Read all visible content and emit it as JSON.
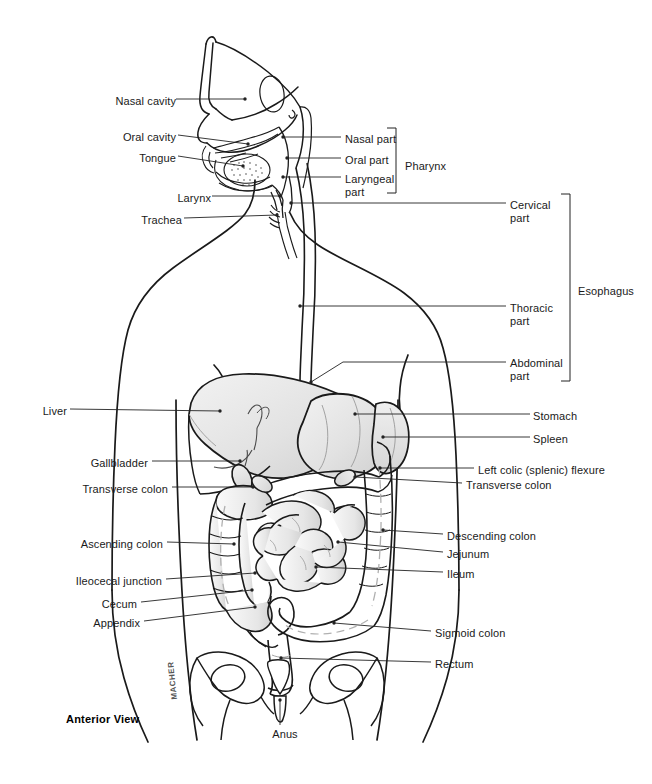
{
  "figure": {
    "view_label": "Anterior View",
    "artist_signature": "MACHER",
    "background_color": "#ffffff",
    "line_color": "#1a1a1a",
    "organ_fill": "#e8e8e8",
    "leader_color": "#222222"
  },
  "labels_left": [
    {
      "id": "nasal-cavity",
      "text": "Nasal cavity",
      "x": 104,
      "y": 95,
      "w": 72
    },
    {
      "id": "oral-cavity",
      "text": "Oral cavity",
      "x": 114,
      "y": 131,
      "w": 62
    },
    {
      "id": "tongue",
      "text": "Tongue",
      "x": 130,
      "y": 152,
      "w": 46
    },
    {
      "id": "larynx",
      "text": "Larynx",
      "x": 165,
      "y": 192,
      "w": 46
    },
    {
      "id": "trachea",
      "text": "Trachea",
      "x": 130,
      "y": 214,
      "w": 52
    },
    {
      "id": "liver",
      "text": "Liver",
      "x": 33,
      "y": 405,
      "w": 34
    },
    {
      "id": "gallbladder",
      "text": "Gallbladder",
      "x": 80,
      "y": 457,
      "w": 68
    },
    {
      "id": "transverse-colon-l",
      "text": "Transverse colon",
      "x": 70,
      "y": 483,
      "w": 98
    },
    {
      "id": "ascending-colon",
      "text": "Ascending colon",
      "x": 63,
      "y": 538,
      "w": 100
    },
    {
      "id": "ileocecal-junction",
      "text": "Ileocecal junction",
      "x": 54,
      "y": 575,
      "w": 108
    },
    {
      "id": "cecum",
      "text": "Cecum",
      "x": 93,
      "y": 598,
      "w": 44
    },
    {
      "id": "appendix",
      "text": "Appendix",
      "x": 84,
      "y": 617,
      "w": 56
    }
  ],
  "labels_right": [
    {
      "id": "nasal-part",
      "text": "Nasal part",
      "x": 345,
      "y": 133,
      "w": 70
    },
    {
      "id": "oral-part",
      "text": "Oral part",
      "x": 345,
      "y": 154,
      "w": 70
    },
    {
      "id": "laryngeal-part",
      "text": "Laryngeal\npart",
      "x": 345,
      "y": 173,
      "w": 70
    },
    {
      "id": "cervical-part",
      "text": "Cervical\npart",
      "x": 510,
      "y": 199,
      "w": 70
    },
    {
      "id": "thoracic-part",
      "text": "Thoracic\npart",
      "x": 510,
      "y": 302,
      "w": 70
    },
    {
      "id": "abdominal-part",
      "text": "Abdominal\npart",
      "x": 510,
      "y": 357,
      "w": 74
    },
    {
      "id": "stomach",
      "text": "Stomach",
      "x": 533,
      "y": 410,
      "w": 70
    },
    {
      "id": "spleen",
      "text": "Spleen",
      "x": 533,
      "y": 433,
      "w": 70
    },
    {
      "id": "left-colic-flexure",
      "text": "Left colic (splenic) flexure",
      "x": 478,
      "y": 464,
      "w": 170
    },
    {
      "id": "transverse-colon-r",
      "text": "Transverse colon",
      "x": 466,
      "y": 479,
      "w": 104
    },
    {
      "id": "descending-colon",
      "text": "Descending colon",
      "x": 447,
      "y": 530,
      "w": 104
    },
    {
      "id": "jejunum",
      "text": "Jejunum",
      "x": 447,
      "y": 548,
      "w": 70
    },
    {
      "id": "ileum",
      "text": "Ileum",
      "x": 447,
      "y": 568,
      "w": 70
    },
    {
      "id": "sigmoid-colon",
      "text": "Sigmoid colon",
      "x": 435,
      "y": 627,
      "w": 94
    },
    {
      "id": "rectum",
      "text": "Rectum",
      "x": 435,
      "y": 658,
      "w": 70
    }
  ],
  "labels_bottom": [
    {
      "id": "anus",
      "text": "Anus",
      "x": 265,
      "y": 728,
      "w": 40
    }
  ],
  "brackets": [
    {
      "id": "pharynx-bracket",
      "label": "Pharynx",
      "label_x": 405,
      "label_y": 160,
      "x": 396,
      "y1": 128,
      "y2": 193
    },
    {
      "id": "esophagus-bracket",
      "label": "Esophagus",
      "label_x": 578,
      "label_y": 285,
      "x": 570,
      "y1": 194,
      "y2": 381
    }
  ],
  "leaders": [
    {
      "id": "leader-nasal-cavity",
      "d": "M176,99 L245,99",
      "dot": [
        245,
        99
      ]
    },
    {
      "id": "leader-oral-cavity",
      "d": "M178,135 L248,144",
      "dot": [
        248,
        144
      ]
    },
    {
      "id": "leader-tongue",
      "d": "M178,156 L243,166",
      "dot": [
        243,
        166
      ]
    },
    {
      "id": "leader-larynx",
      "d": "M212,196 L280,196",
      "dot": [
        280,
        196
      ]
    },
    {
      "id": "leader-trachea",
      "d": "M184,218 L277,215",
      "dot": [
        277,
        215
      ]
    },
    {
      "id": "leader-nasal-part",
      "d": "M341,137 L283,137",
      "dot": [
        283,
        137
      ]
    },
    {
      "id": "leader-oral-part",
      "d": "M341,158 L287,158",
      "dot": [
        287,
        158
      ]
    },
    {
      "id": "leader-laryngeal-part",
      "d": "M341,177 L283,177",
      "dot": [
        283,
        177
      ]
    },
    {
      "id": "leader-cervical-part",
      "d": "M506,203 L291,203",
      "dot": [
        291,
        203
      ]
    },
    {
      "id": "leader-thoracic-part",
      "d": "M506,306 L300,306",
      "dot": [
        300,
        306
      ]
    },
    {
      "id": "leader-abdominal-part",
      "d": "M506,362 L343,362 L311,382",
      "dot": [
        311,
        382
      ]
    },
    {
      "id": "leader-stomach",
      "d": "M530,414 L355,414",
      "dot": [
        355,
        414
      ]
    },
    {
      "id": "leader-spleen",
      "d": "M530,437 L383,437",
      "dot": [
        383,
        437
      ]
    },
    {
      "id": "leader-left-colic",
      "d": "M474,468 L380,468",
      "dot": [
        380,
        468
      ]
    },
    {
      "id": "leader-transverse-colon-r",
      "d": "M462,483 L355,477",
      "dot": [
        355,
        477
      ]
    },
    {
      "id": "leader-descending-colon",
      "d": "M443,534 L383,530",
      "dot": [
        383,
        530
      ]
    },
    {
      "id": "leader-jejunum",
      "d": "M443,552 L338,542",
      "dot": [
        338,
        542
      ]
    },
    {
      "id": "leader-ileum",
      "d": "M443,572 L316,567",
      "dot": [
        316,
        567
      ]
    },
    {
      "id": "leader-sigmoid-colon",
      "d": "M431,631 L334,623",
      "dot": [
        334,
        623
      ]
    },
    {
      "id": "leader-rectum",
      "d": "M431,662 L281,658",
      "dot": [
        281,
        658
      ]
    },
    {
      "id": "leader-liver",
      "d": "M70,409 L220,411",
      "dot": [
        220,
        411
      ]
    },
    {
      "id": "leader-gallbladder",
      "d": "M152,461 L240,461",
      "dot": [
        240,
        461
      ]
    },
    {
      "id": "leader-transverse-colon-l",
      "d": "M172,487 L253,487",
      "dot": [
        253,
        487
      ]
    },
    {
      "id": "leader-ascending-colon",
      "d": "M167,542 L234,544",
      "dot": [
        234,
        544
      ]
    },
    {
      "id": "leader-ileocecal-junction",
      "d": "M166,579 L255,573",
      "dot": [
        255,
        573
      ]
    },
    {
      "id": "leader-cecum",
      "d": "M141,602 L252,590",
      "dot": [
        252,
        590
      ]
    },
    {
      "id": "leader-appendix",
      "d": "M144,621 L255,607",
      "dot": [
        255,
        607
      ]
    },
    {
      "id": "leader-anus",
      "d": "M280,725 L280,700",
      "dot": [
        280,
        700
      ]
    }
  ]
}
